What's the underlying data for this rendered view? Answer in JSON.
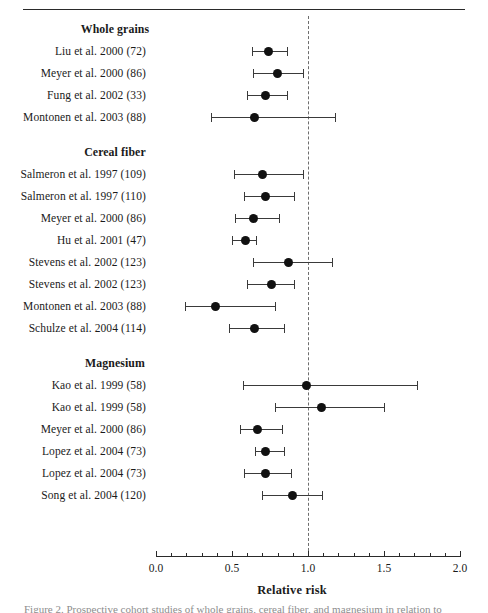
{
  "figure": {
    "axis_title": "Relative risk",
    "caption_fragment": "Figure 2. Prospective cohort studies of whole grains, cereal fiber, and magnesium in relation to",
    "colors": {
      "point": "#111111",
      "line": "#3a3a3a",
      "reference": "#6d6d6d",
      "axis": "#2a2a2a",
      "background": "#ffffff"
    }
  },
  "chart_data": {
    "type": "scatter",
    "title": "",
    "xlabel": "Relative risk",
    "ylabel": "",
    "xlim": [
      0.0,
      2.0
    ],
    "grid": false,
    "legend": "none",
    "reference_line": 1.0,
    "xticks": [
      0.0,
      0.5,
      1.0,
      1.5,
      2.0
    ],
    "xticklabels": [
      "0.0",
      "0.5",
      "1.0",
      "1.5",
      "2.0"
    ],
    "minor_tick_step": 0.1,
    "groups": [
      {
        "label": "Whole grains",
        "studies": [
          {
            "label": "Liu et al. 2000 (72)",
            "rr": 0.74,
            "lcl": 0.63,
            "ucl": 0.86
          },
          {
            "label": "Meyer et al. 2000 (86)",
            "rr": 0.8,
            "lcl": 0.64,
            "ucl": 0.97
          },
          {
            "label": "Fung et al. 2002 (33)",
            "rr": 0.72,
            "lcl": 0.6,
            "ucl": 0.86
          },
          {
            "label": "Montonen et al. 2003 (88)",
            "rr": 0.65,
            "lcl": 0.36,
            "ucl": 1.18
          }
        ]
      },
      {
        "label": "Cereal fiber",
        "studies": [
          {
            "label": "Salmeron et al. 1997 (109)",
            "rr": 0.7,
            "lcl": 0.51,
            "ucl": 0.97
          },
          {
            "label": "Salmeron et al. 1997 (110)",
            "rr": 0.72,
            "lcl": 0.58,
            "ucl": 0.91
          },
          {
            "label": "Meyer et al. 2000 (86)",
            "rr": 0.64,
            "lcl": 0.52,
            "ucl": 0.81
          },
          {
            "label": "Hu et al. 2001 (47)",
            "rr": 0.59,
            "lcl": 0.5,
            "ucl": 0.66
          },
          {
            "label": "Stevens et al. 2002 (123)",
            "rr": 0.87,
            "lcl": 0.64,
            "ucl": 1.16
          },
          {
            "label": "Stevens et al. 2002 (123)",
            "rr": 0.76,
            "lcl": 0.6,
            "ucl": 0.91
          },
          {
            "label": "Montonen et al. 2003  (88)",
            "rr": 0.39,
            "lcl": 0.19,
            "ucl": 0.78
          },
          {
            "label": "Schulze et al. 2004 (114)",
            "rr": 0.65,
            "lcl": 0.48,
            "ucl": 0.84
          }
        ]
      },
      {
        "label": "Magnesium",
        "studies": [
          {
            "label": "Kao et al. 1999 (58)",
            "rr": 0.99,
            "lcl": 0.57,
            "ucl": 1.72
          },
          {
            "label": "Kao et al. 1999 (58)",
            "rr": 1.09,
            "lcl": 0.78,
            "ucl": 1.5
          },
          {
            "label": "Meyer et al. 2000 (86)",
            "rr": 0.67,
            "lcl": 0.55,
            "ucl": 0.83
          },
          {
            "label": "Lopez et al. 2004 (73)",
            "rr": 0.72,
            "lcl": 0.65,
            "ucl": 0.84
          },
          {
            "label": "Lopez et al. 2004 (73)",
            "rr": 0.72,
            "lcl": 0.58,
            "ucl": 0.89
          },
          {
            "label": "Song et al. 2004 (120)",
            "rr": 0.9,
            "lcl": 0.7,
            "ucl": 1.09
          }
        ]
      }
    ]
  }
}
